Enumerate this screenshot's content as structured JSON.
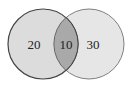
{
  "diagram": {
    "type": "venn",
    "sets": [
      {
        "name": "left-set",
        "only_value": "20"
      },
      {
        "name": "right-set",
        "only_value": "30"
      }
    ],
    "intersection_value": "10",
    "colors": {
      "left_fill": "#dcdcdc",
      "right_fill": "#e6e6e6",
      "intersection_fill": "#a9a9a9",
      "left_stroke": "#444444",
      "right_stroke": "#777777"
    }
  }
}
